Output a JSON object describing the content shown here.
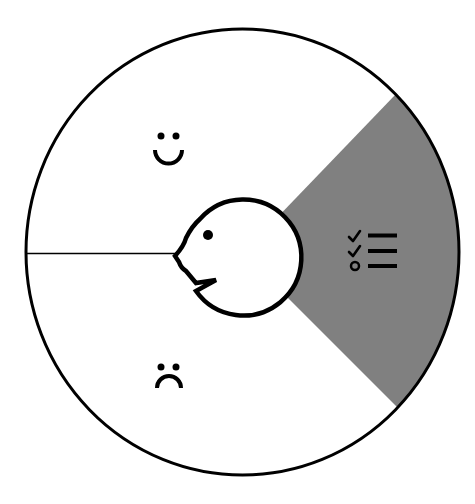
{
  "diagram": {
    "type": "segmented-wheel",
    "center_icon": "face-profile-speaking-icon",
    "segments": [
      {
        "id": "positive",
        "icon": "smiley-face-icon",
        "highlighted": false
      },
      {
        "id": "negative",
        "icon": "sad-face-icon",
        "highlighted": false
      },
      {
        "id": "checklist",
        "icon": "checklist-icon",
        "highlighted": true
      }
    ],
    "colors": {
      "background": "#ffffff",
      "outline": "#000000",
      "highlight": "#808080",
      "segment_fill": "#ffffff"
    }
  }
}
